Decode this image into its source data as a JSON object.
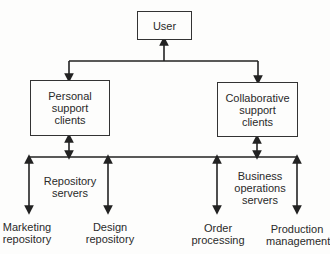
{
  "diagram": {
    "nodes": {
      "user": "User",
      "personal": "Personal\nsupport\nclients",
      "collab": "Collaborative\nsupport\nclients"
    },
    "groups": {
      "repository_servers": "Repository\nservers",
      "business_servers": "Business\noperations\nservers"
    },
    "leaves": {
      "marketing": "Marketing\nrepository",
      "design": "Design\nrepository",
      "order": "Order\nprocessing",
      "production": "Production\nmanagement"
    },
    "colors": {
      "line": "#222222",
      "background": "#fdfdfc"
    }
  }
}
